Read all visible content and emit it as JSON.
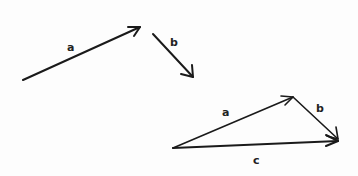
{
  "diagram": {
    "type": "vector-addition",
    "colors": {
      "stroke": "#1a1a1a",
      "background": "#fdfdfd"
    },
    "separate_vectors": [
      {
        "name": "a",
        "label": "a",
        "from": [
          23,
          80
        ],
        "to": [
          140,
          27
        ],
        "label_pos": [
          70,
          49
        ]
      },
      {
        "name": "b",
        "label": "b",
        "from": [
          153,
          34
        ],
        "to": [
          193,
          77
        ],
        "label_pos": [
          174,
          44
        ]
      }
    ],
    "triangle": {
      "a": {
        "label": "a",
        "from": [
          173,
          148
        ],
        "to": [
          293,
          97
        ],
        "label_pos": [
          225,
          114
        ]
      },
      "b": {
        "label": "b",
        "from": [
          293,
          97
        ],
        "to": [
          338,
          139
        ],
        "label_pos": [
          318,
          110
        ]
      },
      "c": {
        "label": "c",
        "from": [
          173,
          148
        ],
        "to": [
          338,
          141
        ],
        "label_pos": [
          257,
          162
        ]
      }
    }
  }
}
